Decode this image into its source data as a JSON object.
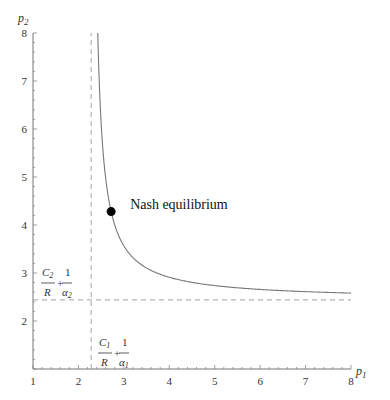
{
  "chart_data": {
    "type": "line",
    "title": "",
    "xlabel": "p1",
    "ylabel": "p2",
    "xlim": [
      1,
      8
    ],
    "ylim": [
      1,
      8
    ],
    "x_ticks": [
      1,
      2,
      3,
      4,
      5,
      6,
      7,
      8
    ],
    "y_ticks": [
      2,
      3,
      4,
      5,
      6,
      7,
      8
    ],
    "grid": false,
    "series": [
      {
        "name": "best-response curve",
        "form": "(p1 - a1)(p2 - a2) = k",
        "a1": 2.28,
        "a2": 2.44,
        "k": 0.81,
        "x": [
          2.43,
          2.5,
          2.6,
          2.72,
          3.0,
          3.5,
          4.0,
          5.0,
          6.0,
          7.0,
          8.0
        ],
        "values": [
          8.0,
          6.12,
          4.97,
          4.28,
          3.57,
          3.1,
          2.91,
          2.74,
          2.66,
          2.61,
          2.58
        ]
      }
    ],
    "asymptotes": {
      "vertical": {
        "x": 2.28,
        "label": "C1/R + 1/α1",
        "style": "dashed"
      },
      "horizontal": {
        "y": 2.44,
        "label": "C2/R + 1/α2",
        "style": "dashed"
      }
    },
    "points": [
      {
        "label": "Nash equilibrium",
        "x": 2.72,
        "y": 4.28
      }
    ]
  },
  "labels": {
    "x_axis": "p",
    "x_axis_sub": "1",
    "y_axis": "p",
    "y_axis_sub": "2",
    "nash": "Nash equilibrium",
    "asym_x": {
      "num1": "C",
      "num1_sub": "1",
      "den1": "R",
      "plus": "+",
      "num2": "1",
      "den2": "α",
      "den2_sub": "1"
    },
    "asym_y": {
      "num1": "C",
      "num1_sub": "2",
      "den1": "R",
      "plus": "+",
      "num2": "1",
      "den2": "α",
      "den2_sub": "2"
    }
  }
}
